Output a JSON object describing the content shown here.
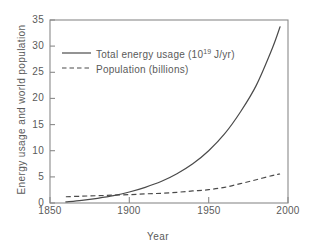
{
  "chart_data": {
    "type": "line",
    "title": "",
    "xlabel": "Year",
    "ylabel": "Energy usage and world population",
    "xlim": [
      1850,
      2000
    ],
    "ylim": [
      0,
      35
    ],
    "xticks": [
      1850,
      1900,
      1950,
      2000
    ],
    "xticklabels": [
      "1850",
      "1900",
      "1950",
      "2000"
    ],
    "yticks": [
      0,
      5,
      10,
      15,
      20,
      25,
      30,
      35
    ],
    "yticklabels": [
      "0",
      "5",
      "10",
      "15",
      "20",
      "25",
      "30",
      "35"
    ],
    "grid": false,
    "legend_position": "upper-left-inside",
    "series": [
      {
        "name": "Total energy usage (10^19 J/yr)",
        "style": "solid",
        "color": "#4a4a4a",
        "x": [
          1860,
          1870,
          1880,
          1890,
          1900,
          1910,
          1920,
          1930,
          1940,
          1950,
          1960,
          1970,
          1980,
          1990,
          1995
        ],
        "values": [
          0.2,
          0.5,
          0.9,
          1.4,
          2.1,
          3.0,
          4.1,
          5.6,
          7.5,
          10.0,
          13.2,
          17.4,
          22.5,
          29.5,
          33.7
        ]
      },
      {
        "name": "Population (billions)",
        "style": "dashed",
        "color": "#4a4a4a",
        "x": [
          1860,
          1870,
          1880,
          1890,
          1900,
          1910,
          1920,
          1930,
          1940,
          1950,
          1960,
          1970,
          1980,
          1990,
          1995
        ],
        "values": [
          1.2,
          1.3,
          1.4,
          1.5,
          1.6,
          1.75,
          1.85,
          2.05,
          2.3,
          2.55,
          3.0,
          3.7,
          4.45,
          5.25,
          5.55
        ]
      }
    ]
  },
  "legend": {
    "entries": [
      {
        "label_prefix": "Total energy usage (10",
        "label_sup": "19",
        "label_suffix": " J/yr)",
        "style": "solid"
      },
      {
        "label_prefix": "Population (billions)",
        "label_sup": "",
        "label_suffix": "",
        "style": "dashed"
      }
    ]
  },
  "axes": {
    "xlabel": "Year",
    "ylabel": "Energy usage and world population",
    "xtick_labels": [
      "1850",
      "1900",
      "1950",
      "2000"
    ],
    "ytick_labels": [
      "0",
      "5",
      "10",
      "15",
      "20",
      "25",
      "30",
      "35"
    ]
  },
  "colors": {
    "line": "#4a4a4a",
    "axis": "#8a8a8a",
    "text": "#5a5a5a",
    "background": "#ffffff"
  }
}
